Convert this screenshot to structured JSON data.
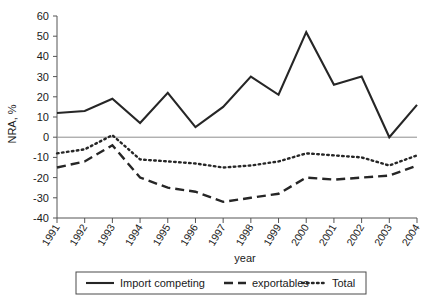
{
  "chart_data": {
    "type": "line",
    "title": "",
    "xlabel": "year",
    "ylabel": "NRA, %",
    "categories": [
      "1991",
      "1992",
      "1993",
      "1994",
      "1995",
      "1996",
      "1997",
      "1998",
      "1999",
      "2000",
      "2001",
      "2002",
      "2003",
      "2004"
    ],
    "x": [
      1991,
      1992,
      1993,
      1994,
      1995,
      1996,
      1997,
      1998,
      1999,
      2000,
      2001,
      2002,
      2003,
      2004
    ],
    "ylim": [
      -40,
      60
    ],
    "xlim": [
      1991,
      2004
    ],
    "ytick_labels": [
      "60",
      "50",
      "40",
      "30",
      "20",
      "10",
      "0",
      "-10",
      "-20",
      "-30",
      "-40"
    ],
    "ytick_values": [
      60,
      50,
      40,
      30,
      20,
      10,
      0,
      -10,
      -20,
      -30,
      -40
    ],
    "grid": false,
    "zero_line": true,
    "legend_position": "bottom",
    "series": [
      {
        "name": "Import competing",
        "style": "solid",
        "color": "#262626",
        "values": [
          12,
          13,
          19,
          7,
          22,
          5,
          15,
          30,
          21,
          52,
          26,
          30,
          0,
          16
        ]
      },
      {
        "name": "exportables",
        "style": "dashed",
        "color": "#262626",
        "values": [
          -15,
          -12,
          -4,
          -20,
          -25,
          -27,
          -32,
          -30,
          -28,
          -20,
          -21,
          -20,
          -19,
          -14
        ]
      },
      {
        "name": "Total",
        "style": "dotted",
        "color": "#262626",
        "values": [
          -8,
          -6,
          1,
          -11,
          -12,
          -13,
          -15,
          -14,
          -12,
          -8,
          -9,
          -10,
          -14,
          -9
        ]
      }
    ]
  },
  "legend": {
    "entries": [
      {
        "label": "Import competing",
        "style": "solid"
      },
      {
        "label": "exportables",
        "style": "dashed"
      },
      {
        "label": "Total",
        "style": "dotted"
      }
    ]
  },
  "axes": {
    "y_title": "NRA, %",
    "x_title": "year"
  }
}
